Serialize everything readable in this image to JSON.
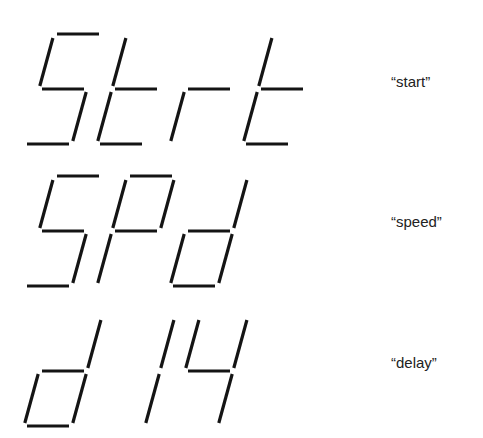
{
  "colors": {
    "segment": "#141414",
    "label": "#222222",
    "background": "#ffffff"
  },
  "geometry": {
    "digit_pitch": 73,
    "first_digit_x": 24,
    "digit_width": 48,
    "digit_height": 110,
    "slant": 30,
    "seg_gap": 3
  },
  "rows": [
    {
      "display": "Strt",
      "label": "“start”",
      "top_y": 34,
      "label_y": 73,
      "digits": [
        {
          "char": "S",
          "segments": [
            "a",
            "f",
            "g",
            "c",
            "d"
          ]
        },
        {
          "char": "t",
          "segments": [
            "f",
            "g",
            "e",
            "d"
          ]
        },
        {
          "char": "r",
          "segments": [
            "g",
            "e"
          ]
        },
        {
          "char": "t",
          "segments": [
            "f",
            "g",
            "e",
            "d"
          ]
        }
      ]
    },
    {
      "display": "SPd",
      "label": "“speed”",
      "top_y": 176,
      "label_y": 213,
      "digits": [
        {
          "char": "S",
          "segments": [
            "a",
            "f",
            "g",
            "c",
            "d"
          ]
        },
        {
          "char": "P",
          "segments": [
            "a",
            "b",
            "f",
            "g",
            "e"
          ]
        },
        {
          "char": "d",
          "segments": [
            "b",
            "g",
            "c",
            "e",
            "d"
          ]
        }
      ]
    },
    {
      "display": "d14",
      "label": "“delay”",
      "top_y": 316,
      "label_y": 354,
      "digits": [
        {
          "char": "d",
          "segments": [
            "b",
            "g",
            "c",
            "e",
            "d"
          ]
        },
        {
          "char": "1",
          "segments": [
            "b",
            "c"
          ]
        },
        {
          "char": "4",
          "segments": [
            "f",
            "b",
            "g",
            "c"
          ]
        }
      ]
    }
  ]
}
